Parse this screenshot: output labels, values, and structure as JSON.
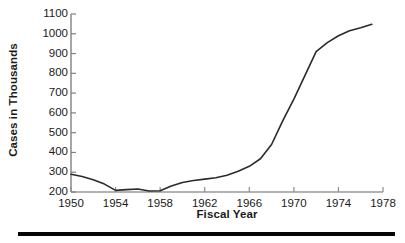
{
  "chart_data": {
    "type": "line",
    "title": "",
    "xlabel": "Fiscal Year",
    "ylabel": "Cases in Thousands",
    "xlim": [
      1950,
      1978
    ],
    "ylim": [
      200,
      1100
    ],
    "xticks": [
      1950,
      1954,
      1958,
      1962,
      1966,
      1970,
      1974,
      1978
    ],
    "xtick_labels": [
      "1950",
      "1954",
      "1958",
      "1962",
      "1966",
      "1970",
      "1974",
      "1978"
    ],
    "yticks": [
      200,
      300,
      400,
      500,
      600,
      700,
      800,
      900,
      1000,
      1100
    ],
    "ytick_labels": [
      "200",
      "300",
      "400",
      "500",
      "600",
      "700",
      "800",
      "900",
      "1000",
      "1100"
    ],
    "grid": false,
    "legend": false,
    "line_color": "#2b2b2b",
    "line_width": 1.6,
    "series": [
      {
        "name": "Cases",
        "x": [
          1950,
          1951,
          1952,
          1953,
          1954,
          1955,
          1956,
          1957,
          1958,
          1959,
          1960,
          1961,
          1962,
          1963,
          1964,
          1965,
          1966,
          1967,
          1968,
          1969,
          1970,
          1971,
          1972,
          1973,
          1974,
          1975,
          1976,
          1977
        ],
        "values": [
          290,
          278,
          262,
          240,
          208,
          212,
          215,
          205,
          206,
          230,
          248,
          258,
          265,
          272,
          285,
          305,
          330,
          368,
          440,
          560,
          670,
          790,
          910,
          955,
          990,
          1015,
          1030,
          1048
        ]
      }
    ]
  },
  "figure": {
    "background_color": "#ffffff",
    "axis_color": "#7f7f7f",
    "text_color": "#1a1a1a",
    "rule_color": "#050505"
  }
}
